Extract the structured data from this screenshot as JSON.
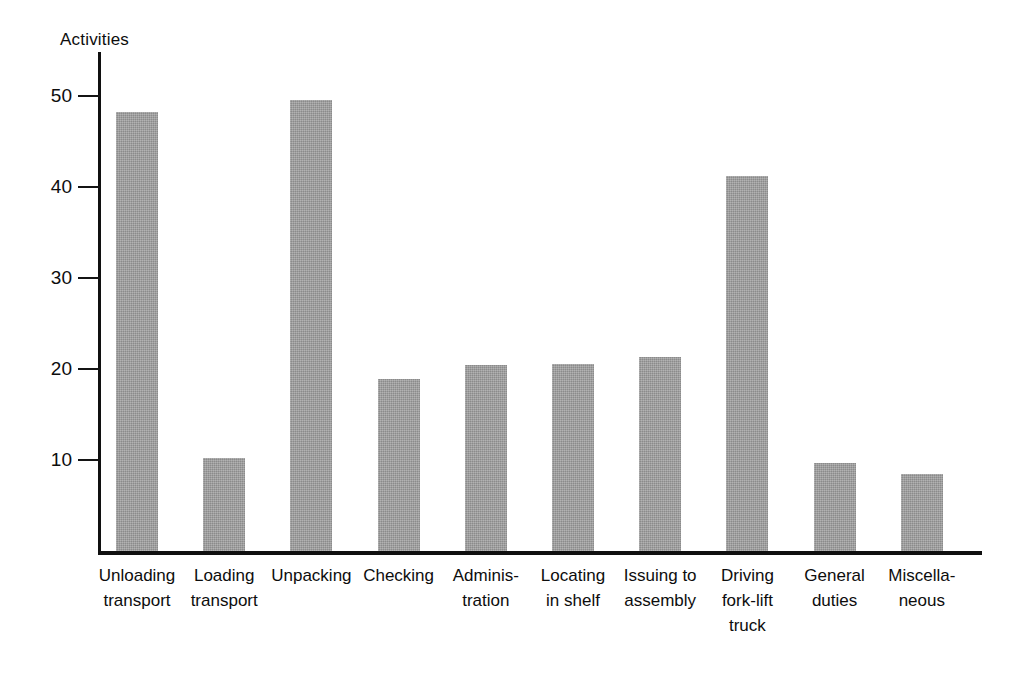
{
  "chart_data": {
    "type": "bar",
    "title": "",
    "subtitle": "",
    "xlabel": "",
    "ylabel": "Activities",
    "ylim": [
      0,
      55
    ],
    "yticks": [
      10,
      20,
      30,
      40,
      50
    ],
    "ytick_labels": [
      "10",
      "20",
      "30",
      "40",
      "50"
    ],
    "grid": false,
    "legend": null,
    "bar_color": "#9a9a9a",
    "axis_color": "#101010",
    "background": "#ffffff",
    "categories": [
      "Unloading\ntransport",
      "Loading\ntransport",
      "Unpacking",
      "Checking",
      "Adminis-\ntration",
      "Locating\nin shelf",
      "Issuing to\nassembly",
      "Driving\nfork-lift\ntruck",
      "General\nduties",
      "Miscella-\nneous"
    ],
    "values": [
      48.2,
      10.2,
      49.6,
      18.9,
      20.4,
      20.5,
      21.3,
      41.2,
      9.7,
      8.5
    ]
  }
}
